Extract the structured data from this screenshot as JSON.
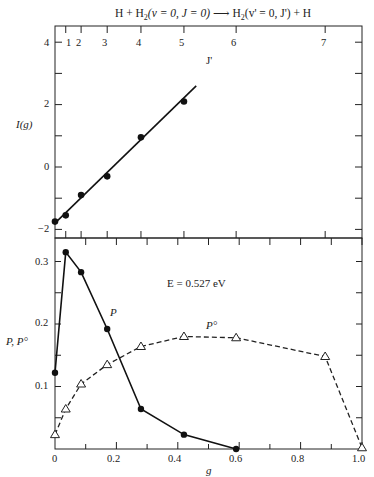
{
  "chart_data": [
    {
      "type": "scatter",
      "panel": "upper",
      "title": "H + H2(v = 0, J = 0) → H2(v' = 0, J') + H",
      "xlabel": "g",
      "ylabel": "I(g)",
      "secondary_xlabel": "J'",
      "ylim": [
        -2.3,
        4.5
      ],
      "xlim": [
        0,
        1.0
      ],
      "yticks": [
        -2,
        0,
        2,
        4
      ],
      "ytick_labels": [
        "−2",
        "0",
        "2",
        "4"
      ],
      "top_axis_ticks": [
        {
          "label": "1",
          "g": 0.035
        },
        {
          "label": "2",
          "g": 0.085
        },
        {
          "label": "3",
          "g": 0.17
        },
        {
          "label": "4",
          "g": 0.28
        },
        {
          "label": "5",
          "g": 0.42
        },
        {
          "label": "6",
          "g": 0.59
        },
        {
          "label": "7",
          "g": 0.88
        }
      ],
      "series": [
        {
          "name": "I(g) data",
          "marker": "filled-circle",
          "x": [
            0.0,
            0.035,
            0.085,
            0.17,
            0.28,
            0.42
          ],
          "y": [
            -1.75,
            -1.55,
            -0.9,
            -0.3,
            0.95,
            2.1
          ]
        },
        {
          "name": "linear fit",
          "style": "solid-line",
          "x": [
            0.0,
            0.46
          ],
          "y": [
            -1.8,
            2.6
          ]
        }
      ],
      "grid": false
    },
    {
      "type": "line",
      "panel": "lower",
      "xlabel": "g",
      "ylabel": "P, P°",
      "annotation": "E = 0.527 eV",
      "xlim": [
        0,
        1.0
      ],
      "ylim": [
        0,
        0.34
      ],
      "xticks": [
        0,
        0.2,
        0.4,
        0.6,
        0.8,
        1.0
      ],
      "xtick_labels": [
        "0",
        "0.2",
        "0.4",
        "0.6",
        "0.8",
        "1.0"
      ],
      "yticks": [
        0.1,
        0.2,
        0.3
      ],
      "ytick_labels": [
        "0.1",
        "0.2",
        "0.3"
      ],
      "series": [
        {
          "name": "P",
          "style": "solid",
          "marker": "filled-circle",
          "x": [
            0.0,
            0.035,
            0.085,
            0.17,
            0.28,
            0.42,
            0.59
          ],
          "y": [
            0.122,
            0.315,
            0.283,
            0.192,
            0.064,
            0.023,
            0.0
          ]
        },
        {
          "name": "P°",
          "style": "dashed",
          "marker": "open-triangle",
          "x": [
            0.0,
            0.035,
            0.085,
            0.17,
            0.28,
            0.42,
            0.59,
            0.88,
            1.0
          ],
          "y": [
            0.023,
            0.064,
            0.104,
            0.135,
            0.164,
            0.18,
            0.178,
            0.148,
            0.002
          ]
        }
      ],
      "grid": false
    }
  ],
  "labels": {
    "title": "H + H",
    "title_sub": "2",
    "title_mid": "(v = 0, J = 0)",
    "title_arrow": "⟶",
    "title_right": "H",
    "title_right_sub": "2",
    "title_right_mid": "(v' = 0, J') + H",
    "jprime": "J'",
    "upper_ylabel": "I(g)",
    "lower_ylabel": "P, P°",
    "xlabel": "g",
    "energy": "E = 0.527 eV",
    "curve_P": "P",
    "curve_P0": "P°",
    "upper_yticks": [
      "4",
      "2",
      "0",
      "−2"
    ],
    "lower_yticks": [
      "0.3",
      "0.2",
      "0.1",
      "0"
    ],
    "xticks": [
      "0",
      "0.2",
      "0.4",
      "0.6",
      "0.8",
      "1.0"
    ],
    "jticks": [
      "1",
      "2",
      "3",
      "4",
      "5",
      "6",
      "7"
    ]
  }
}
